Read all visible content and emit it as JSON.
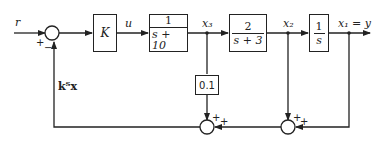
{
  "diagram": {
    "type": "block-diagram",
    "signals": {
      "input": "r",
      "control": "u",
      "x3": "x₃",
      "x2": "x₂",
      "output": "x₁ = y",
      "feedback": "kᵀx"
    },
    "blocks": {
      "gain": {
        "label": "K"
      },
      "plant1": {
        "num": "1",
        "den": "s + 10"
      },
      "plant2": {
        "num": "2",
        "den": "s + 3"
      },
      "integrator": {
        "num": "1",
        "den": "s"
      },
      "feedback_gain": {
        "label": "0.1"
      }
    },
    "summing_junctions": {
      "main": {
        "signs": [
          "+",
          "−"
        ]
      },
      "sum_left": {
        "signs": [
          "+",
          "+"
        ]
      },
      "sum_right": {
        "signs": [
          "+",
          "+"
        ]
      }
    }
  }
}
